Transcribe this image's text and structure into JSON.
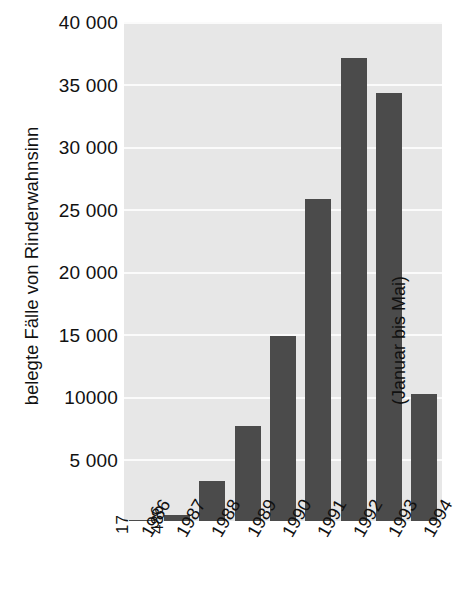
{
  "chart_data": {
    "type": "bar",
    "title": "",
    "subtitle": "",
    "xlabel": "",
    "ylabel": "belegte Fälle von Rinderwahnsinn",
    "categories": [
      "1986",
      "1987",
      "1988",
      "1989",
      "1990",
      "1991",
      "1992",
      "1993",
      "1994"
    ],
    "values": [
      17,
      486,
      3200,
      7600,
      14800,
      25800,
      37100,
      34300,
      10200
    ],
    "ylim": [
      0,
      40000
    ],
    "y_ticks": [
      5000,
      10000,
      15000,
      20000,
      25000,
      30000,
      35000,
      40000
    ],
    "y_tick_labels": [
      "5 000",
      "10000",
      "15 000",
      "20 000",
      "25 000",
      "30 000",
      "35 000",
      "40 000"
    ],
    "grid": true,
    "legend": "none",
    "bar_color": "#4b4b4b",
    "plot_background": "#e7e7e7",
    "gridline_color": "#fbfbfb",
    "page_background": "#ffffff",
    "data_labels": [
      {
        "category": "1986",
        "text": "17"
      },
      {
        "category": "1987",
        "text": "486"
      }
    ],
    "annotations": [
      {
        "text": "(Januar bis Mai)",
        "category": "1994",
        "rotation": -90
      }
    ]
  },
  "axes": {
    "y_title": "belegte Fälle von Rinderwahnsinn",
    "y_tick_labels": [
      "40 000",
      "35 000",
      "30 000",
      "25 000",
      "20 000",
      "15 000",
      "10000",
      "5 000"
    ],
    "x_tick_labels": [
      "1986",
      "1987",
      "1988",
      "1989",
      "1990",
      "1991",
      "1992",
      "1993",
      "1994"
    ]
  },
  "annotations": {
    "note_1994": "(Januar bis Mai)",
    "value_1986": "17",
    "value_1987": "486"
  }
}
